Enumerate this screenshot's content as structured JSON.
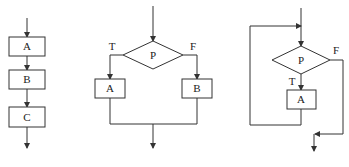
{
  "diagrams": [
    {
      "name": "sequence-structure",
      "boxes": [
        "A",
        "B",
        "C"
      ]
    },
    {
      "name": "selection-structure",
      "condition": "P",
      "true_label": "T",
      "false_label": "F",
      "true_box": "A",
      "false_box": "B"
    },
    {
      "name": "loop-structure",
      "condition": "P",
      "true_label": "T",
      "false_label": "F",
      "body_box": "A"
    }
  ]
}
